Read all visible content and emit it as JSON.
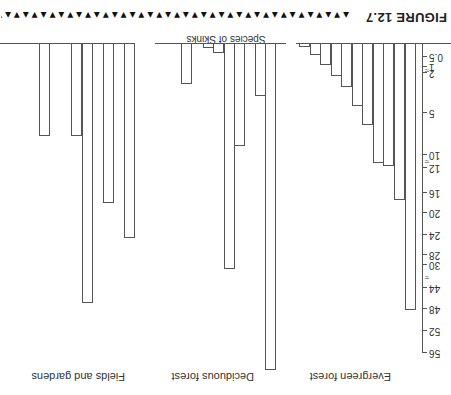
{
  "figure": {
    "title": "FIGURE 12.7",
    "decoration": "▲▼▲▼▲▼▲▼▲▼▲▼▲▼▲▼▲▼▲▼▲▼▲▼▲▼▲▼▲▼▲▼▲▼▲▼▲▼▲▼▲▼▲▼▲▼▲▼▲▼▲▼▲▼▲▼▲▼▲▼▲▼▲▼▲▼",
    "orientation": "rotated 180°"
  },
  "chart_data": {
    "type": "bar",
    "title": "FIGURE 12.7",
    "xlabel": "Species of Skinks",
    "ylabel": "",
    "y_ticks": [
      "0.5",
      "1",
      "2",
      "5",
      "10",
      "12",
      "16",
      "20",
      "24",
      "28",
      "30",
      "44",
      "48",
      "52",
      "56"
    ],
    "axis_breaks": [
      "between 1 and 2",
      "between 10 and 12",
      "between 30 and 44"
    ],
    "ylim": [
      0,
      56
    ],
    "grid": false,
    "legend": null,
    "panels": [
      {
        "name": "Evergreen forest",
        "values": [
          0.2,
          0.5,
          1,
          1.5,
          2.5,
          4,
          6,
          10.5,
          11.5,
          17,
          48
        ]
      },
      {
        "name": "Deciduous forest",
        "values": [
          0,
          2.3,
          0,
          0.2,
          0.4,
          31,
          8,
          0,
          3.5,
          0,
          58
        ]
      },
      {
        "name": "Fields and gardens",
        "values": [
          6.5,
          0,
          0,
          6.5,
          47,
          0,
          18,
          0,
          25,
          0,
          0
        ]
      }
    ]
  },
  "labels": {
    "xlabel": "Species of Skinks",
    "groups": [
      "Evergreen forest",
      "Deciduous forest",
      "Fields and gardens"
    ],
    "ticks": [
      {
        "label": "0.5",
        "y": 338
      },
      {
        "label": "1",
        "y": 328
      },
      {
        "label": "2",
        "y": 322
      },
      {
        "label": "5",
        "y": 282
      },
      {
        "label": "10",
        "y": 240
      },
      {
        "label": "12",
        "y": 227
      },
      {
        "label": "16",
        "y": 202
      },
      {
        "label": "20",
        "y": 182
      },
      {
        "label": "24",
        "y": 160
      },
      {
        "label": "28",
        "y": 140
      },
      {
        "label": "30",
        "y": 130
      },
      {
        "label": "44",
        "y": 107
      },
      {
        "label": "48",
        "y": 86
      },
      {
        "label": "52",
        "y": 64
      },
      {
        "label": "56",
        "y": 42
      }
    ]
  }
}
